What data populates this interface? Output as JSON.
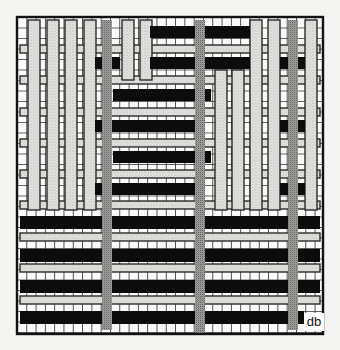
{
  "diagram": {
    "signature": "db",
    "frame": {
      "x": 17,
      "y": 17,
      "w": 306,
      "h": 317
    },
    "colors": {
      "background": "#f4f4f2",
      "cell": "#fafafa",
      "grid": "#2a2a2a",
      "light_stipple": "#dcdcd8",
      "dark_stipple": "#9a9a96",
      "black": "#0c0c0c"
    },
    "grid": {
      "col_step": 9.3,
      "row_step": 10.5
    },
    "light_warps": [
      {
        "x": 28,
        "y": 20,
        "w": 12,
        "h": 190
      },
      {
        "x": 47,
        "y": 20,
        "w": 12,
        "h": 190
      },
      {
        "x": 65,
        "y": 20,
        "w": 12,
        "h": 190
      },
      {
        "x": 84,
        "y": 20,
        "w": 12,
        "h": 190
      },
      {
        "x": 122,
        "y": 20,
        "w": 12,
        "h": 60
      },
      {
        "x": 140,
        "y": 20,
        "w": 12,
        "h": 60
      },
      {
        "x": 250,
        "y": 20,
        "w": 12,
        "h": 190
      },
      {
        "x": 268,
        "y": 20,
        "w": 12,
        "h": 190
      },
      {
        "x": 305,
        "y": 20,
        "w": 12,
        "h": 190
      },
      {
        "x": 215,
        "y": 70,
        "w": 12,
        "h": 140
      },
      {
        "x": 232,
        "y": 70,
        "w": 12,
        "h": 140
      }
    ],
    "light_wefts": [
      {
        "x": 20,
        "y": 45,
        "w": 300,
        "h": 8
      },
      {
        "x": 20,
        "y": 76,
        "w": 300,
        "h": 8
      },
      {
        "x": 20,
        "y": 108,
        "w": 300,
        "h": 8
      },
      {
        "x": 20,
        "y": 139,
        "w": 300,
        "h": 8
      },
      {
        "x": 20,
        "y": 170,
        "w": 300,
        "h": 8
      },
      {
        "x": 20,
        "y": 201,
        "w": 300,
        "h": 8
      },
      {
        "x": 20,
        "y": 233,
        "w": 300,
        "h": 8
      },
      {
        "x": 20,
        "y": 264,
        "w": 300,
        "h": 8
      },
      {
        "x": 20,
        "y": 296,
        "w": 300,
        "h": 8
      }
    ],
    "dark_warps": [
      {
        "x": 102,
        "y": 20,
        "w": 10,
        "h": 310
      },
      {
        "x": 195,
        "y": 20,
        "w": 10,
        "h": 310
      },
      {
        "x": 288,
        "y": 20,
        "w": 10,
        "h": 310
      }
    ],
    "black_bars": [
      {
        "x": 150,
        "y": 26,
        "w": 100,
        "h": 12
      },
      {
        "x": 95,
        "y": 57,
        "w": 25,
        "h": 12
      },
      {
        "x": 150,
        "y": 57,
        "w": 100,
        "h": 12
      },
      {
        "x": 280,
        "y": 57,
        "w": 25,
        "h": 12
      },
      {
        "x": 113,
        "y": 89,
        "w": 98,
        "h": 12
      },
      {
        "x": 95,
        "y": 120,
        "w": 100,
        "h": 12
      },
      {
        "x": 280,
        "y": 120,
        "w": 25,
        "h": 12
      },
      {
        "x": 113,
        "y": 151,
        "w": 98,
        "h": 12
      },
      {
        "x": 95,
        "y": 183,
        "w": 100,
        "h": 12
      },
      {
        "x": 280,
        "y": 183,
        "w": 25,
        "h": 12
      },
      {
        "x": 20,
        "y": 216,
        "w": 300,
        "h": 13
      },
      {
        "x": 20,
        "y": 249,
        "w": 300,
        "h": 13
      },
      {
        "x": 20,
        "y": 280,
        "w": 300,
        "h": 13
      },
      {
        "x": 20,
        "y": 311,
        "w": 284,
        "h": 13
      }
    ],
    "dark_over_black": [
      {
        "x": 102,
        "y": 210,
        "w": 10,
        "h": 28
      },
      {
        "x": 288,
        "y": 210,
        "w": 10,
        "h": 28
      },
      {
        "x": 195,
        "y": 243,
        "w": 10,
        "h": 28
      },
      {
        "x": 102,
        "y": 274,
        "w": 10,
        "h": 28
      },
      {
        "x": 288,
        "y": 274,
        "w": 10,
        "h": 28
      },
      {
        "x": 195,
        "y": 305,
        "w": 10,
        "h": 28
      },
      {
        "x": 195,
        "y": 50,
        "w": 10,
        "h": 28
      },
      {
        "x": 102,
        "y": 80,
        "w": 10,
        "h": 30
      }
    ]
  }
}
